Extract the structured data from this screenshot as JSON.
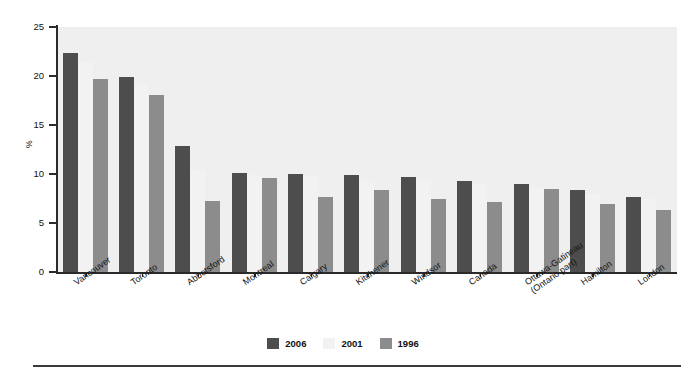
{
  "chart_data": {
    "type": "bar",
    "title": "",
    "subtitle": "",
    "xlabel": "",
    "ylabel": "%",
    "ylim": [
      0,
      25
    ],
    "yticks": [
      0,
      5,
      10,
      15,
      20,
      25
    ],
    "grid": false,
    "legend_position": "bottom-center",
    "categories": [
      "Vancouver",
      "Toronto",
      "Abbotsford",
      "Montreal",
      "Calgary",
      "Kitchener",
      "Windsor",
      "Canada",
      "Ottawa-Gatineau (Ontario part)",
      "Hamilton",
      "London"
    ],
    "categories_lines": [
      [
        "Vancouver"
      ],
      [
        "Toronto"
      ],
      [
        "Abbotsford"
      ],
      [
        "Montreal"
      ],
      [
        "Calgary"
      ],
      [
        "Kitchener"
      ],
      [
        "Windsor"
      ],
      [
        "Canada"
      ],
      [
        "Ottawa-Gatineau",
        "(Ontario part)"
      ],
      [
        "Hamilton"
      ],
      [
        "London"
      ]
    ],
    "series": [
      {
        "name": "2006",
        "color": "#4d4d4d",
        "values": [
          22.3,
          19.9,
          12.9,
          10.1,
          10.0,
          9.9,
          9.7,
          9.3,
          9.0,
          8.4,
          7.7
        ]
      },
      {
        "name": "2001",
        "color": "#f2f2f2",
        "values": [
          21.4,
          19.1,
          10.4,
          9.9,
          9.8,
          9.3,
          9.5,
          9.0,
          8.6,
          8.0,
          7.4
        ]
      },
      {
        "name": "1996",
        "color": "#8c8c8c",
        "values": [
          19.7,
          18.1,
          7.2,
          9.6,
          7.7,
          8.4,
          7.4,
          7.1,
          8.5,
          6.9,
          6.3
        ]
      }
    ]
  },
  "legend": {
    "items": [
      {
        "label": "2006",
        "color": "#4d4d4d"
      },
      {
        "label": "2001",
        "color": "#f2f2f2"
      },
      {
        "label": "1996",
        "color": "#8c8c8c"
      }
    ]
  },
  "axis": {
    "y_title": "%",
    "y_tick_labels": [
      "0",
      "5",
      "10",
      "15",
      "20",
      "25"
    ]
  },
  "colors": {
    "plot_background": "#efefef",
    "page_background": "#ffffff",
    "axis": "#2b2b2b",
    "series_2006": "#4d4d4d",
    "series_2001": "#f2f2f2",
    "series_1996": "#8c8c8c"
  }
}
